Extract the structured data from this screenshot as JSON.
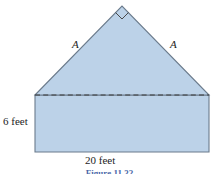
{
  "figure": {
    "shape_type": "house (rectangle topped by right isosceles triangle)",
    "colors": {
      "fill": "#bcd2e8",
      "outline": "#6b7b8c",
      "dashed_line": "#3c3c3c",
      "label": "#1d1d1d",
      "caption": "#4a68a8",
      "background": "#ffffff"
    },
    "labels": {
      "left_side": "A",
      "right_side": "A",
      "height": "6 feet",
      "base": "20 feet"
    },
    "caption": "Figure 11.32",
    "markers": {
      "right_angle": "right-angle square at apex"
    },
    "geometry": {
      "apex": [
        122,
        6
      ],
      "left_eave": [
        35,
        95
      ],
      "right_eave": [
        209,
        95
      ],
      "left_base": [
        35,
        152
      ],
      "right_base": [
        209,
        152
      ],
      "dashed_line_y": 95,
      "right_angle_size": 9
    }
  }
}
